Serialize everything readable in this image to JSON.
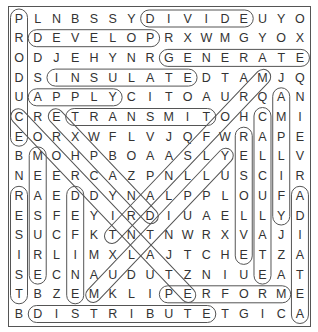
{
  "puzzle": {
    "rows": 16,
    "cols": 16,
    "grid": [
      "PLNBSSYDIVIDEUYO",
      "RDEVELOPRXWMGYOX",
      "ODJEHYNRGENERATE",
      "DSINSULATEDTAMJQ",
      "UAPPLYCITOAURQAN",
      "CRETRANSMITOHCMI",
      "EORXWFLVJQFWRAPE",
      "BMOHPBOAASLYELLV",
      "NEERCAZPNLLUSCIR",
      "RAEDDYNALPPLOUFA",
      "ESFEYIRDIUAELLYD",
      "SUCFKTNTNWRXVAJI",
      "IRLIMXLAJTCHETZA",
      "SECNAUDUTZNIUEAT",
      "TBZEMKLIPERFORME",
      "BDISTRIBUTETGICA"
    ],
    "found_words": [
      {
        "word": "PRODUCE",
        "start": [
          0,
          0
        ],
        "end": [
          6,
          0
        ]
      },
      {
        "word": "DIVIDE",
        "start": [
          0,
          7
        ],
        "end": [
          0,
          12
        ]
      },
      {
        "word": "DEVELOP",
        "start": [
          1,
          1
        ],
        "end": [
          1,
          7
        ]
      },
      {
        "word": "GENERATE",
        "start": [
          2,
          8
        ],
        "end": [
          2,
          15
        ]
      },
      {
        "word": "INSULATE",
        "start": [
          3,
          2
        ],
        "end": [
          3,
          9
        ]
      },
      {
        "word": "APPLY",
        "start": [
          4,
          1
        ],
        "end": [
          4,
          5
        ]
      },
      {
        "word": "TRANSMIT",
        "start": [
          5,
          3
        ],
        "end": [
          5,
          10
        ]
      },
      {
        "word": "AMPLIFY",
        "start": [
          4,
          14
        ],
        "end": [
          10,
          14
        ]
      },
      {
        "word": "CALCULATE",
        "start": [
          5,
          13
        ],
        "end": [
          13,
          13
        ]
      },
      {
        "word": "RESOLVE",
        "start": [
          6,
          12
        ],
        "end": [
          12,
          12
        ]
      },
      {
        "word": "MEASURE",
        "start": [
          7,
          1
        ],
        "end": [
          13,
          1
        ]
      },
      {
        "word": "RESIST",
        "start": [
          9,
          0
        ],
        "end": [
          14,
          0
        ]
      },
      {
        "word": "DEFINE",
        "start": [
          9,
          3
        ],
        "end": [
          14,
          3
        ]
      },
      {
        "word": "RADIATE",
        "start": [
          9,
          15
        ],
        "end": [
          15,
          15
        ]
      },
      {
        "word": "PERFORM",
        "start": [
          14,
          8
        ],
        "end": [
          14,
          14
        ]
      },
      {
        "word": "DISTRIBUTE",
        "start": [
          15,
          1
        ],
        "end": [
          15,
          10
        ]
      },
      {
        "word": "COORDINATE",
        "start": [
          5,
          0
        ],
        "end": [
          14,
          9
        ]
      },
      {
        "word": "EXPAND",
        "start": [
          5,
          2
        ],
        "end": [
          10,
          7
        ]
      },
      {
        "word": "MULTIPLY",
        "start": [
          14,
          4
        ],
        "end": [
          7,
          11
        ]
      },
      {
        "word": "TRANSFORM",
        "start": [
          11,
          5
        ],
        "end": [
          3,
          13
        ]
      }
    ],
    "colors": {
      "letter": "#333333",
      "outline": "#555555",
      "background": "#ffffff"
    }
  }
}
